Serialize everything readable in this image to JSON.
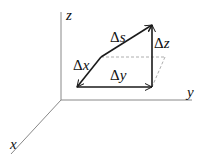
{
  "diagram": {
    "axes": {
      "x_label": "x",
      "y_label": "y",
      "z_label": "z"
    },
    "vectors": {
      "dx": {
        "delta": "Δ",
        "var": "x"
      },
      "dy": {
        "delta": "Δ",
        "var": "y"
      },
      "dz": {
        "delta": "Δ",
        "var": "z"
      },
      "ds": {
        "delta": "Δ",
        "var": "s"
      }
    },
    "colors": {
      "axis": "#888888",
      "vector": "#1a1a1a",
      "dashed": "#999999"
    }
  }
}
